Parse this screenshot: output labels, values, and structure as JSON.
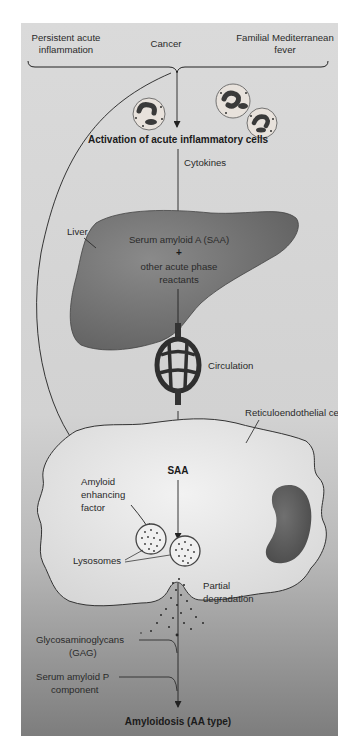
{
  "diagram": {
    "causes": {
      "left_line1": "Persistent acute",
      "left_line2": "inflammation",
      "center": "Cancer",
      "right_line1": "Familial Mediterranean",
      "right_line2": "fever"
    },
    "activation": "Activation of acute inflammatory cells",
    "cytokines": "Cytokines",
    "liver": {
      "label": "Liver",
      "saa": "Serum amyloid A (SAA)",
      "plus": "+",
      "other_line1": "other acute phase",
      "other_line2": "reactants"
    },
    "circulation": "Circulation",
    "re_cell": {
      "label": "Reticuloendothelial cell",
      "saa": "SAA",
      "aef_line1": "Amyloid",
      "aef_line2": "enhancing",
      "aef_line3": "factor",
      "lysosomes": "Lysosomes",
      "partial_line1": "Partial",
      "partial_line2": "degradation"
    },
    "gag_line1": "Glycosaminoglycans",
    "gag_line2": "(GAG)",
    "sap_line1": "Serum amyloid P",
    "sap_line2": "component",
    "result": "Amyloidosis (AA type)",
    "colors": {
      "panel_top": "#d9d9d9",
      "panel_bottom": "#7f7f7f",
      "liver": "#6e6e6e",
      "nucleus": "#5a5a5a",
      "cell_fill": "#e4e4e4",
      "line": "#222222"
    }
  }
}
